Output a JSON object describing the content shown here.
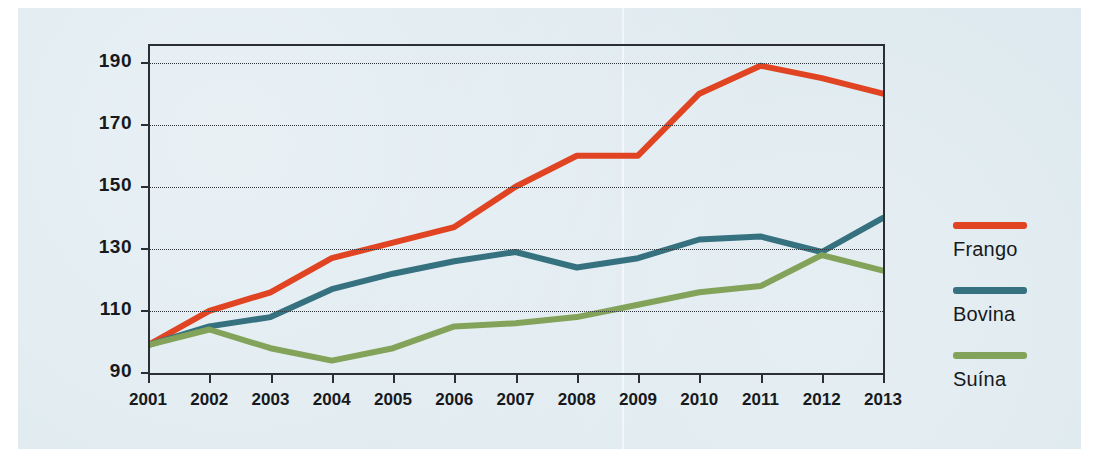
{
  "chart_data": {
    "type": "line",
    "title": "",
    "xlabel": "",
    "ylabel": "",
    "categories": [
      "2001",
      "2002",
      "2003",
      "2004",
      "2005",
      "2006",
      "2007",
      "2008",
      "2009",
      "2010",
      "2011",
      "2012",
      "2013"
    ],
    "x": [
      2001,
      2002,
      2003,
      2004,
      2005,
      2006,
      2007,
      2008,
      2009,
      2010,
      2011,
      2012,
      2013
    ],
    "ylim": [
      90,
      196
    ],
    "yticks": [
      90,
      110,
      130,
      150,
      170,
      190
    ],
    "ytick_labels": [
      "90",
      "110",
      "130",
      "150",
      "170",
      "190"
    ],
    "grid": "horizontal-dotted",
    "legend_position": "right",
    "series": [
      {
        "name": "Frango",
        "color": "#e04422",
        "values": [
          99,
          110,
          116,
          127,
          132,
          137,
          150,
          160,
          160,
          180,
          189,
          185,
          180
        ]
      },
      {
        "name": "Bovina",
        "color": "#35717f",
        "values": [
          99,
          105,
          108,
          117,
          122,
          126,
          129,
          124,
          127,
          133,
          134,
          129,
          140
        ]
      },
      {
        "name": "Suína",
        "color": "#84a35a",
        "values": [
          99,
          104,
          98,
          94,
          98,
          105,
          106,
          108,
          112,
          116,
          118,
          128,
          123
        ]
      }
    ]
  },
  "legend": {
    "items": [
      {
        "label": "Frango",
        "color": "#e04422"
      },
      {
        "label": "Bovina",
        "color": "#35717f"
      },
      {
        "label": "Suína",
        "color": "#84a35a"
      }
    ]
  },
  "colors": {
    "background": "#dde9ef",
    "page": "#ffffff",
    "axis": "#2b2f33",
    "text": "#17191c",
    "frango": "#e04422",
    "bovina": "#35717f",
    "suina": "#84a35a"
  }
}
